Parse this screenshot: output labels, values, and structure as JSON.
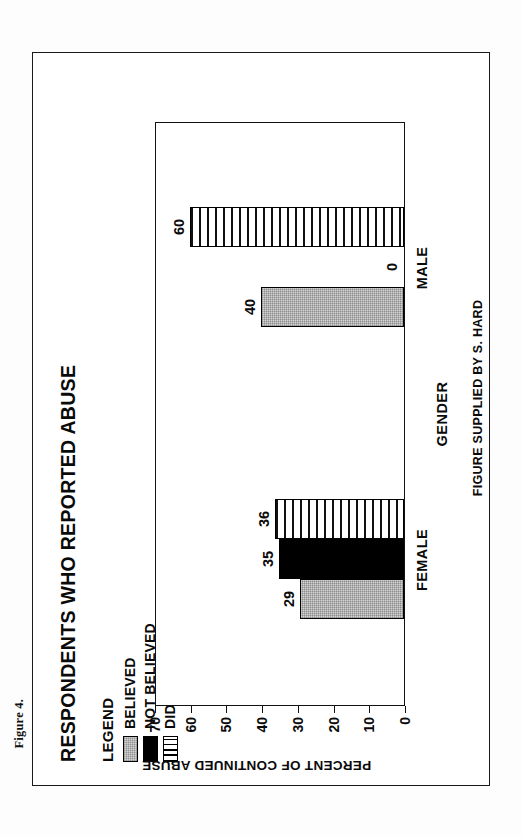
{
  "page": {
    "figure_number": "Figure 4.",
    "source_note": "FIGURE SUPPLIED BY S. HARD"
  },
  "legend": {
    "title": "LEGEND",
    "items": [
      {
        "label": "BELIEVED",
        "swatch": "light-gray-stipple",
        "color": "#d4d4d4"
      },
      {
        "label": "NOT BELIEVED",
        "swatch": "solid-black",
        "color": "#000000"
      },
      {
        "label": "DIDN'T TELL",
        "swatch": "horizontal-stripes",
        "color": "#ffffff"
      }
    ]
  },
  "chart_data": {
    "type": "bar",
    "title": "RESPONDENTS WHO REPORTED ABUSE",
    "xlabel": "GENDER",
    "ylabel": "PERCENT OF CONTINUED ABUSE",
    "categories": [
      "FEMALE",
      "MALE"
    ],
    "series": [
      {
        "name": "BELIEVED",
        "values": [
          29,
          40
        ]
      },
      {
        "name": "NOT BELIEVED",
        "values": [
          35,
          0
        ]
      },
      {
        "name": "DIDN'T TELL",
        "values": [
          36,
          60
        ]
      }
    ],
    "ylim": [
      0,
      70
    ],
    "yticks": [
      0,
      10,
      20,
      30,
      40,
      50,
      60,
      70
    ],
    "ytick_labels": [
      "0",
      "10",
      "20",
      "30",
      "40",
      "50",
      "60",
      "70"
    ],
    "grid": false,
    "legend_position": "top-right",
    "data_labels": [
      "29",
      "35",
      "36",
      "40",
      "0",
      "60"
    ]
  }
}
